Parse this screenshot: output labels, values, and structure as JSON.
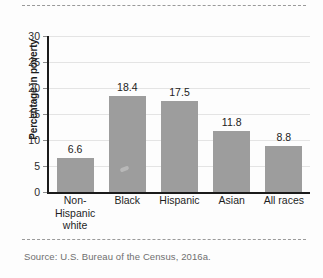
{
  "chart_data": {
    "type": "bar",
    "title": "",
    "xlabel": "",
    "ylabel": "Percentage in poverty",
    "categories": [
      "Non-Hispanic white",
      "Black",
      "Hispanic",
      "Asian",
      "All races"
    ],
    "category_lines": [
      [
        "Non-Hispanic",
        "white"
      ],
      [
        "Black"
      ],
      [
        "Hispanic"
      ],
      [
        "Asian"
      ],
      [
        "All races"
      ]
    ],
    "values": [
      6.6,
      18.4,
      17.5,
      11.8,
      8.8
    ],
    "value_labels": [
      "6.6",
      "18.4",
      "17.5",
      "11.8",
      "8.8"
    ],
    "ylim": [
      0,
      30
    ],
    "yticks": [
      0,
      5,
      10,
      15,
      20,
      25,
      30
    ],
    "ytick_labels": [
      "0",
      "5",
      "10",
      "15",
      "20",
      "25",
      "30"
    ],
    "grid": true,
    "legend": "none",
    "bar_color": "#9d9d9d",
    "axis_color": "#1b1b1b",
    "grid_color": "#e4e4e4"
  },
  "source": {
    "text": "Source: U.S. Bureau of the Census, 2016a."
  }
}
